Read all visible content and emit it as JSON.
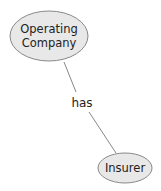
{
  "diagram": {
    "nodes": [
      {
        "id": "operating-company",
        "label_lines": [
          "Operating",
          "Company"
        ],
        "fill": "#e8e8e8",
        "stroke": "#888888"
      },
      {
        "id": "insurer",
        "label": "Insurer",
        "fill": "#e8e8e8",
        "stroke": "#888888"
      }
    ],
    "edges": [
      {
        "from": "operating-company",
        "to": "insurer",
        "label": "has",
        "color": "#888888"
      }
    ]
  }
}
